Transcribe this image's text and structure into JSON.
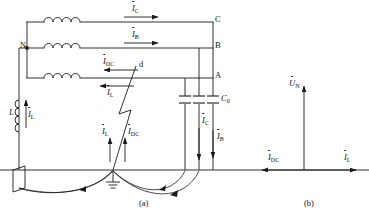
{
  "figure": {
    "title_a": "(a)",
    "title_b": "(b)"
  },
  "phase_lines": {
    "c_label": "C",
    "b_label": "B",
    "a_label": "A"
  },
  "neutral": {
    "node_label": "N"
  },
  "coil": {
    "inductor_label": "L",
    "current_label": "I",
    "current_sub": "L"
  },
  "currents": {
    "ic_label": "I",
    "ic_sub": "C",
    "ib_label": "I",
    "ib_sub": "B",
    "idc_top_label": "I",
    "idc_top_sub": "DC",
    "il_top_label": "I",
    "il_top_sub": "L",
    "il_gnd_label": "I",
    "il_gnd_sub": "L",
    "idc_gnd_label": "I",
    "idc_gnd_sub": "DC",
    "ic_cap_label": "I",
    "ic_cap_sub": "C",
    "ib_cap_label": "I",
    "ib_cap_sub": "B"
  },
  "capacitor": {
    "label": "C",
    "sub": "0"
  },
  "fault": {
    "point_label": "d"
  },
  "phasor": {
    "un_label": "U",
    "un_sub": "N",
    "idc_label": "I",
    "idc_sub": "DC",
    "il_label": "I",
    "il_sub": "L"
  },
  "colors": {
    "line": "#1a1a1a",
    "background": "#ffffff"
  }
}
